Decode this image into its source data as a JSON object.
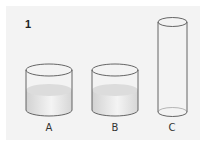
{
  "figure": {
    "number": "1",
    "background_color": "#f3f3f3",
    "containers": [
      {
        "label": "A",
        "shape": "short wide cylinder",
        "filled": true,
        "fill_color": "#e6e6e6"
      },
      {
        "label": "B",
        "shape": "short wide cylinder",
        "filled": true,
        "fill_color": "#e6e6e6"
      },
      {
        "label": "C",
        "shape": "tall narrow cylinder",
        "filled": false
      }
    ]
  }
}
